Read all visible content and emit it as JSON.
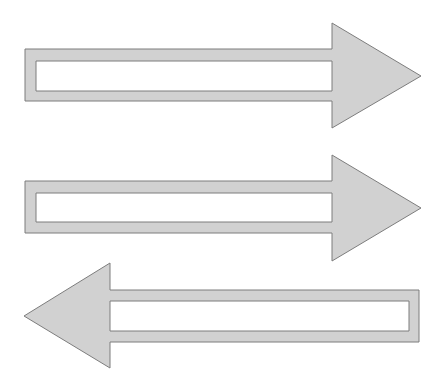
{
  "diagram": {
    "colors": {
      "fill": "#d1d1d1",
      "stroke": "#7d7d7d",
      "inner": "#ffffff",
      "background": "#ffffff"
    },
    "arrows": [
      {
        "id": "arrow-1",
        "direction": "right",
        "outline": "25,49 332,49 332,23 421,76 332,128 332,101 25,101",
        "hole": "36,61 332,61 332,91 36,91"
      },
      {
        "id": "arrow-2",
        "direction": "right",
        "outline": "25,181 332,181 332,155 421,208 332,261 332,233 25,233",
        "hole": "36,193 332,193 332,222 36,222"
      },
      {
        "id": "arrow-3",
        "direction": "left",
        "outline": "419,290 110,290 110,263 24,316 110,368 110,342 419,342",
        "hole": "409,301 110,301 110,331 409,331"
      }
    ]
  }
}
